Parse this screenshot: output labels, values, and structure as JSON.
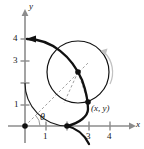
{
  "figure": {
    "type": "math-diagram",
    "axes": {
      "x_label": "x",
      "y_label": "y",
      "x_ticks": [
        "1",
        "2",
        "3",
        "4"
      ],
      "x_tick_labels_shown": [
        "1",
        "3",
        "4"
      ],
      "y_ticks": [
        "1",
        "2",
        "3",
        "4"
      ],
      "y_tick_labels_shown": [
        "1",
        "3",
        "4"
      ],
      "x_range": [
        0,
        4.6
      ],
      "y_range": [
        0,
        4.6
      ],
      "axis_color": "#8c8c8c",
      "grid": false
    },
    "labels": {
      "point": "(x, y)",
      "angle": "θ",
      "y_axis": "y",
      "x_axis": "x",
      "tick_y4": "4",
      "tick_y3": "3",
      "tick_y1": "1",
      "tick_x1": "1",
      "tick_x3": "3",
      "tick_x4": "4"
    },
    "colors": {
      "curve": "#111111",
      "thin_curve": "#1a1a1a",
      "axis": "#8c8c8c",
      "dashed": "#9a9a9a",
      "rotation_arrow": "#bdbdbd",
      "dot": "#111111"
    },
    "markers": {
      "origin_dot": true,
      "cusp_dot_at_x": "2",
      "circle_center_dot": true,
      "point_xy_dot": true,
      "curve_start_arrow_at": "(0, 4)"
    },
    "rolling_circle": {
      "radius": "1",
      "center": "(2.45, 1.85)"
    },
    "guide_arc": {
      "radius": "2",
      "from": "(0, 2)",
      "to": "(2, 0)"
    },
    "rotation_indicator": "counterclockwise-arc-arrow"
  }
}
